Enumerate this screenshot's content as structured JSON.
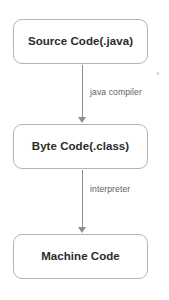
{
  "diagram": {
    "type": "flowchart",
    "orientation": "vertical",
    "background_color": "#ffffff",
    "box_border_color": "#b4b4b4",
    "box_text_color": "#2b2b2b",
    "arrow_color": "#8d8d8d",
    "edge_label_color": "#5e5e5e",
    "nodes": [
      {
        "id": "source",
        "label": "Source Code(.java)"
      },
      {
        "id": "byte",
        "label": "Byte Code(.class)"
      },
      {
        "id": "machine",
        "label": "Machine Code"
      }
    ],
    "edges": [
      {
        "id": "compile",
        "label": "java compiler",
        "from": "source",
        "to": "byte"
      },
      {
        "id": "interpret",
        "label": "interpreter",
        "from": "byte",
        "to": "machine"
      }
    ],
    "icons": {
      "arrow_down": "arrow-down-icon"
    }
  }
}
